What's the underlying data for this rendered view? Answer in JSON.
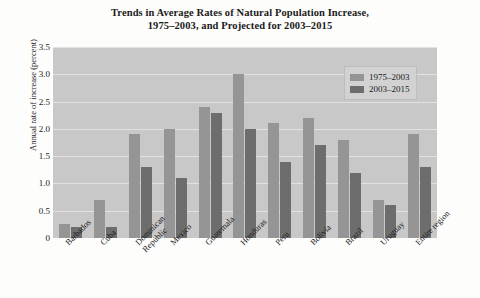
{
  "chart_data": {
    "type": "bar",
    "title": "Trends in Average Rates of Natural Population Increase, 1975–2003, and Projected for 2003–2015",
    "title_line1": "Trends in Average Rates of Natural Population Increase,",
    "title_line2": "1975–2003, and Projected for 2003–2015",
    "xlabel": "",
    "ylabel": "Annual rate of increase (percent)",
    "ylim": [
      0,
      3.5
    ],
    "ytick_labels": [
      "3.5",
      "3.0",
      "2.5",
      "2.0",
      "1.5",
      "1.0",
      "0.5",
      "0"
    ],
    "ytick_values": [
      3.5,
      3.0,
      2.5,
      2.0,
      1.5,
      1.0,
      0.5,
      0
    ],
    "grid": true,
    "legend_position": "top-right",
    "categories": [
      "Barbados",
      "Cuba",
      "Dominican Republic",
      "Mexico",
      "Guatemala",
      "Honduras",
      "Peru",
      "Bolivia",
      "Brazil",
      "Uruguay",
      "Entire region"
    ],
    "category_lines": [
      [
        "Barbados"
      ],
      [
        "Cuba"
      ],
      [
        "Dominican",
        "Republic"
      ],
      [
        "Mexico"
      ],
      [
        "Guatemala"
      ],
      [
        "Honduras"
      ],
      [
        "Peru"
      ],
      [
        "Bolivia"
      ],
      [
        "Brazil"
      ],
      [
        "Uruguay"
      ],
      [
        "Entire region"
      ]
    ],
    "series": [
      {
        "name": "1975–2003",
        "color": "#959595",
        "values": [
          0.25,
          0.7,
          1.9,
          2.0,
          2.4,
          3.0,
          2.1,
          2.2,
          1.8,
          0.7,
          1.9
        ]
      },
      {
        "name": "2003–2015",
        "color": "#6d6d6d",
        "values": [
          0.2,
          0.2,
          1.3,
          1.1,
          2.3,
          2.0,
          1.4,
          1.7,
          1.2,
          0.6,
          1.3
        ]
      }
    ],
    "plot_background": "#c8c8c8",
    "gridline_color": "#e2e2e2"
  },
  "margin_text": ""
}
